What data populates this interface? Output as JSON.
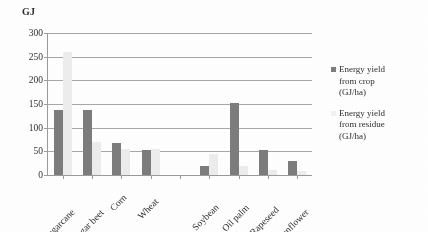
{
  "chart_data": {
    "type": "bar",
    "title": "",
    "subtitle": "",
    "xlabel": "",
    "ylabel": "GJ",
    "ylim": [
      0,
      300
    ],
    "ytick_step": 50,
    "yticks": [
      0,
      50,
      100,
      150,
      200,
      250,
      300
    ],
    "grid": true,
    "legend_position": "right",
    "categories": [
      "Sugarcane",
      "Sugar beet",
      "Corn",
      "Wheat",
      "",
      "Soybean",
      "Oil palm",
      "Rapeseed",
      "Sunflower"
    ],
    "series": [
      {
        "name": "Energy yield from crop (GJ/ha)",
        "color": "#7c7c7c",
        "values": [
          137,
          137,
          68,
          52,
          0,
          18,
          153,
          52,
          30
        ]
      },
      {
        "name": "Energy yield from residue (GJ/ha)",
        "color": "#ececec",
        "values": [
          260,
          70,
          55,
          55,
          0,
          45,
          20,
          10,
          8
        ]
      }
    ]
  },
  "axis": {
    "y_title": "GJ"
  },
  "legend": {
    "entries": [
      {
        "label_line1": "Energy yield",
        "label_line2": "from crop",
        "label_line3": "(GJ/ha)",
        "swatch": "crop"
      },
      {
        "label_line1": "Energy yield",
        "label_line2": "from residue",
        "label_line3": "(GJ/ha)",
        "swatch": "residue"
      }
    ]
  },
  "colors": {
    "crop_series": "#7c7c7c",
    "residue_series": "#ececec",
    "gridline": "#a8a8a8",
    "axis": "#9a9a9a",
    "text": "#2e2e2e",
    "background": "#fefefe"
  }
}
